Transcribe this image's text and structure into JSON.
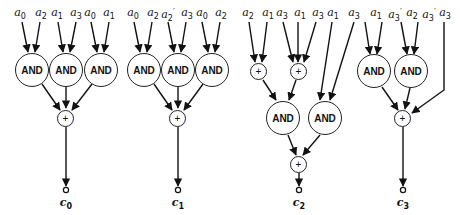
{
  "diagram": {
    "type": "logic-circuit",
    "circuits": [
      {
        "output": "c0",
        "inputs": [
          "a0",
          "a2",
          "a1",
          "a3",
          "a0",
          "a1"
        ],
        "gates": [
          "AND",
          "AND",
          "AND",
          "+"
        ]
      },
      {
        "output": "c1",
        "inputs": [
          "a0",
          "a2",
          "a2'",
          "a3",
          "a0",
          "a2"
        ],
        "gates": [
          "AND",
          "AND",
          "AND",
          "+"
        ]
      },
      {
        "output": "c2",
        "inputs": [
          "a2",
          "a1",
          "a3",
          "a1",
          "a3",
          "a1",
          "a3"
        ],
        "gates": [
          "+",
          "+",
          "AND",
          "AND",
          "+"
        ]
      },
      {
        "output": "c3",
        "inputs": [
          "a1",
          "a3'",
          "a2",
          "a3'",
          "a3"
        ],
        "gates": [
          "AND",
          "AND",
          "+"
        ]
      }
    ],
    "labels": {
      "and": "AND",
      "xor": "+"
    }
  }
}
